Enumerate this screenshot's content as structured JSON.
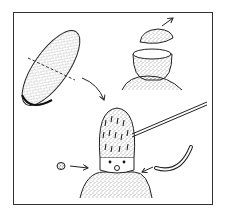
{
  "illustration": {
    "description": "Craft instruction: egg-shaped figure with cap, stick, nose ball and collar strip",
    "colors": {
      "ink": "#222222",
      "paper": "#ffffff",
      "frame": "#333333"
    },
    "parts": [
      {
        "name": "egg-halved",
        "label": ""
      },
      {
        "name": "cup-on-body",
        "label": ""
      },
      {
        "name": "lid",
        "label": ""
      },
      {
        "name": "head-with-stick",
        "label": ""
      },
      {
        "name": "nose-ball",
        "label": ""
      },
      {
        "name": "collar-strip",
        "label": ""
      }
    ]
  }
}
